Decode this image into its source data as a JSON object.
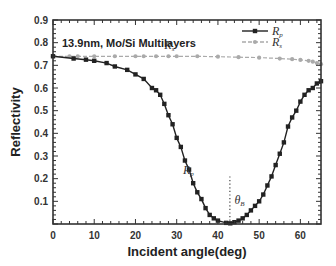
{
  "chart_data": {
    "type": "line",
    "title": "",
    "annotation": "13.9nm, Mo/Si Multilayers",
    "xlabel": "Incident angle(deg)",
    "ylabel": "Reflectivity",
    "xlim": [
      0,
      65
    ],
    "ylim": [
      0,
      0.9
    ],
    "xticks": [
      0,
      10,
      20,
      30,
      40,
      50,
      60
    ],
    "yticks": [
      0.1,
      0.2,
      0.3,
      0.4,
      0.5,
      0.6,
      0.7,
      0.8,
      0.9
    ],
    "xtick_labels": [
      "0",
      "10",
      "20",
      "30",
      "40",
      "50",
      "60"
    ],
    "ytick_labels": [
      "0.1",
      "0.2",
      "0.3",
      "0.4",
      "0.5",
      "0.6",
      "0.7",
      "0.8",
      "0.9"
    ],
    "grid": false,
    "legend_position": "upper right",
    "series": [
      {
        "name": "Rp",
        "label_main": "R",
        "label_sub": "p",
        "color": "#222222",
        "marker": "square",
        "x": [
          0,
          5,
          8,
          10,
          13,
          15,
          18,
          20,
          22,
          24,
          25,
          26,
          27,
          28,
          29,
          30,
          31,
          32,
          33,
          34,
          35,
          36,
          37,
          38,
          39,
          40,
          42,
          43,
          44,
          45,
          46,
          47,
          48,
          49,
          50,
          51,
          52,
          53,
          54,
          55,
          56,
          57,
          58,
          59,
          60,
          61,
          62,
          63,
          64,
          65
        ],
        "values": [
          0.74,
          0.73,
          0.725,
          0.72,
          0.71,
          0.695,
          0.68,
          0.66,
          0.64,
          0.6,
          0.59,
          0.57,
          0.53,
          0.48,
          0.44,
          0.38,
          0.34,
          0.28,
          0.24,
          0.18,
          0.14,
          0.11,
          0.07,
          0.04,
          0.025,
          0.015,
          0.005,
          0.003,
          0.008,
          0.015,
          0.025,
          0.04,
          0.06,
          0.08,
          0.1,
          0.13,
          0.17,
          0.21,
          0.26,
          0.31,
          0.36,
          0.43,
          0.47,
          0.5,
          0.54,
          0.57,
          0.59,
          0.6,
          0.62,
          0.63
        ]
      },
      {
        "name": "Rs",
        "label_main": "R",
        "label_sub": "s",
        "color": "#aaaaaa",
        "marker": "circle",
        "x": [
          0,
          4,
          6,
          10,
          15,
          20,
          22,
          25,
          28,
          30,
          35,
          40,
          45,
          50,
          55,
          58,
          60,
          62,
          63,
          64,
          65
        ],
        "values": [
          0.74,
          0.74,
          0.74,
          0.74,
          0.74,
          0.74,
          0.74,
          0.74,
          0.74,
          0.74,
          0.74,
          0.738,
          0.736,
          0.734,
          0.73,
          0.727,
          0.724,
          0.72,
          0.716,
          0.71,
          0.705
        ]
      }
    ],
    "annotations": [
      {
        "text": "Rs",
        "main": "R",
        "sub": "s",
        "x": 27,
        "y": 0.77
      },
      {
        "text": "Rp",
        "main": "R",
        "sub": "p",
        "x": 31.5,
        "y": 0.22
      },
      {
        "text": "θB",
        "main": "θ",
        "sub": "B",
        "x": 44,
        "y": 0.09,
        "vline_x": 42.9,
        "vline_ymax": 0.21
      }
    ]
  }
}
